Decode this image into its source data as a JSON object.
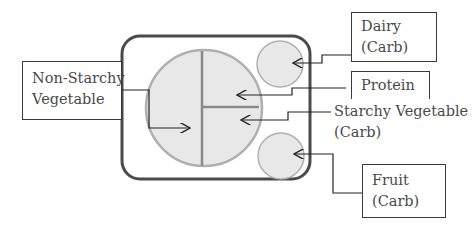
{
  "diagram": {
    "colors": {
      "plate_border": "#4a4a4a",
      "food_fill": "#e8e8e8",
      "food_border": "#b0b0b0",
      "divider": "#8a8a8a",
      "leader_line": "#222222",
      "text": "#4a4a4a"
    },
    "labels": {
      "non_starchy": {
        "line1": "Non-Starchy",
        "line2": "Vegetable"
      },
      "dairy": {
        "line1": "Dairy",
        "line2": "(Carb)"
      },
      "protein": {
        "line1": "Protein"
      },
      "starchy": {
        "line1": "Starchy Vegetable",
        "line2": "(Carb)"
      },
      "fruit": {
        "line1": "Fruit",
        "line2": "(Carb)"
      }
    }
  }
}
